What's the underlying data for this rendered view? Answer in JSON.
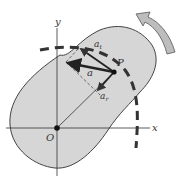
{
  "diagram": {
    "type": "rigid-body-rotation-acceleration",
    "labels": {
      "y_axis": "y",
      "x_axis": "x",
      "origin": "O",
      "point": "P",
      "accel": "a",
      "tangential": "a",
      "tangential_sub": "t",
      "radial": "a",
      "radial_sub": "r"
    },
    "colors": {
      "body_fill": "#d6d6d6",
      "body_stroke": "#444444",
      "arrow": "#222222",
      "rotation_arrow_fill": "#bdbdbd",
      "dashed_path": "#333333"
    }
  }
}
